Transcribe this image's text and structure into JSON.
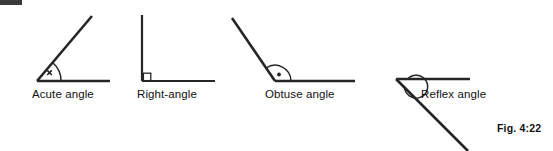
{
  "figure": {
    "label": "Fig. 4:22",
    "stroke_color": "#262626",
    "background_color": "#ffffff",
    "width": 553,
    "height": 151
  },
  "diagrams": [
    {
      "id": "acute",
      "caption": "Acute angle",
      "marker": "x",
      "marker_type": "cross-mark",
      "arc": "single-arc",
      "description": "Angle less than 90 degrees formed by a horizontal ray and an upward sloping ray"
    },
    {
      "id": "right",
      "caption": "Right-angle",
      "marker": "",
      "marker_type": "square-mark",
      "arc": "square",
      "description": "Angle of exactly 90 degrees formed by a vertical ray and a horizontal ray"
    },
    {
      "id": "obtuse",
      "caption": "Obtuse angle",
      "marker": "•",
      "marker_type": "dot-mark",
      "arc": "single-arc",
      "description": "Angle greater than 90 degrees and less than 180 degrees"
    },
    {
      "id": "reflex",
      "caption": "Reflex angle",
      "marker": "",
      "marker_type": "none",
      "arc": "full-circle-arc",
      "description": "Angle greater than 180 degrees and less than 360 degrees"
    }
  ],
  "artifact": {
    "name": "scan-edge-artifact",
    "color": "#3a3a3a"
  }
}
